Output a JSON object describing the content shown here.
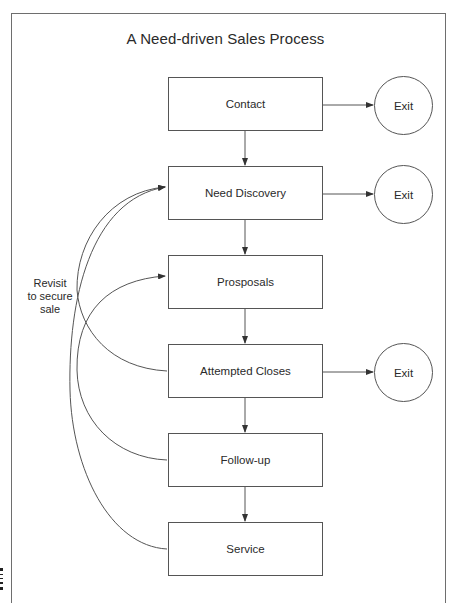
{
  "title": "A Need-driven Sales Process",
  "steps": [
    {
      "label": "Contact",
      "top": 77,
      "has_exit": true
    },
    {
      "label": "Need Discovery",
      "top": 166,
      "has_exit": true
    },
    {
      "label": "Prosposals",
      "top": 255,
      "has_exit": false
    },
    {
      "label": "Attempted Closes",
      "top": 344,
      "has_exit": true
    },
    {
      "label": "Follow-up",
      "top": 433,
      "has_exit": false
    },
    {
      "label": "Service",
      "top": 522,
      "has_exit": false
    }
  ],
  "exit_label": "Exit",
  "exits": [
    "Exit",
    "Exit",
    "Exit"
  ],
  "revisit_note": {
    "line1": "Revisit",
    "line2": "to secure",
    "line3": "sale"
  },
  "revisit_arrows": [
    {
      "from": "Attempted Closes",
      "to": "Need Discovery"
    },
    {
      "from": "Service",
      "to": "Need Discovery"
    },
    {
      "from": "Follow-up",
      "to": "Prosposals"
    }
  ],
  "colors": {
    "line": "#555555",
    "text": "#2a2a2a",
    "background": "#ffffff"
  }
}
